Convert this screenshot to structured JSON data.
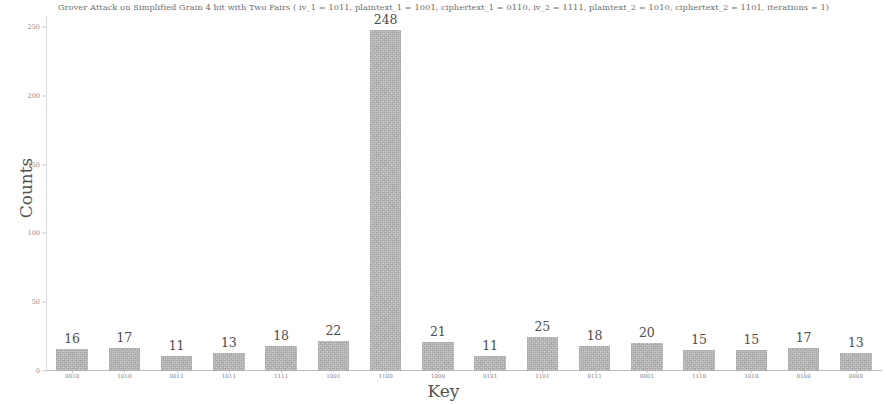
{
  "chart_data": {
    "type": "bar",
    "title": "Grover Attack on Simplified Grain 4 bit with Two Pairs ( iv_1 = 1011, plaintext_1 = 1001, ciphertext_1 = 0110, iv_2 = 1111, plaintext_2 = 1010, ciphertext_2 = 1101, iterations = 1)",
    "xlabel": "Key",
    "ylabel": "Counts",
    "categories": [
      "0010",
      "1010",
      "0011",
      "1011",
      "1111",
      "1001",
      "1100",
      "1000",
      "0101",
      "1101",
      "0111",
      "0001",
      "1110",
      "1010",
      "0100",
      "0000"
    ],
    "values": [
      16,
      17,
      11,
      13,
      18,
      22,
      248,
      21,
      11,
      25,
      18,
      20,
      15,
      15,
      17,
      13
    ],
    "value_labels": [
      "16",
      "17",
      "11",
      "13",
      "18",
      "22",
      "248",
      "21",
      "11",
      "25",
      "18",
      "20",
      "15",
      "15",
      "17",
      "13"
    ],
    "ylim": [
      0,
      258
    ],
    "yticks": [
      0,
      50,
      100,
      150,
      200,
      250
    ],
    "ytick_labels": [
      "0",
      "50",
      "100",
      "150",
      "200",
      "250"
    ],
    "grid": false,
    "legend": "none",
    "bar_color": "#cfcfcf",
    "text_color": "#4d4d4d",
    "peak_category": "1100",
    "peak_value": 248
  }
}
